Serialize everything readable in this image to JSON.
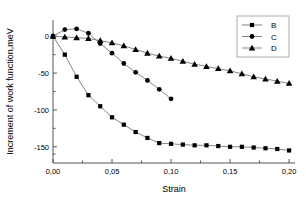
{
  "chart_data": {
    "type": "line",
    "title": "",
    "xlabel": "Strain",
    "ylabel": "Increment of work function,meV",
    "xlim": [
      0.0,
      0.205
    ],
    "ylim": [
      -172,
      22
    ],
    "grid": false,
    "legend_position": "top-right",
    "xticks": [
      "0,00",
      "0,05",
      "0,10",
      "0,15",
      "0,20"
    ],
    "xtick_values": [
      0.0,
      0.05,
      0.1,
      0.15,
      0.2
    ],
    "yticks": [
      "0",
      "-50",
      "-100",
      "-150"
    ],
    "ytick_values": [
      0,
      -50,
      -100,
      -150
    ],
    "series": [
      {
        "name": "B",
        "marker": "square",
        "color": "#000000",
        "x": [
          0.0,
          0.01,
          0.02,
          0.03,
          0.04,
          0.05,
          0.06,
          0.07,
          0.08,
          0.09,
          0.1,
          0.11,
          0.12,
          0.13,
          0.14,
          0.15,
          0.16,
          0.17,
          0.18,
          0.19,
          0.2
        ],
        "values": [
          0,
          -25,
          -55,
          -80,
          -95,
          -110,
          -120,
          -130,
          -138,
          -145,
          -146,
          -147,
          -148,
          -148,
          -149,
          -150,
          -150,
          -151,
          -152,
          -153,
          -155
        ]
      },
      {
        "name": "C",
        "marker": "circle",
        "color": "#000000",
        "x": [
          0.0,
          0.01,
          0.02,
          0.03,
          0.04,
          0.05,
          0.06,
          0.07,
          0.08,
          0.09,
          0.1
        ],
        "values": [
          0,
          9,
          10,
          4,
          -10,
          -23,
          -37,
          -49,
          -60,
          -72,
          -85
        ]
      },
      {
        "name": "D",
        "marker": "triangle",
        "color": "#000000",
        "x": [
          0.0,
          0.01,
          0.02,
          0.03,
          0.04,
          0.05,
          0.06,
          0.07,
          0.08,
          0.09,
          0.1,
          0.11,
          0.12,
          0.13,
          0.14,
          0.15,
          0.16,
          0.17,
          0.18,
          0.19,
          0.2
        ],
        "values": [
          0,
          -1,
          -2,
          -3,
          -6,
          -9,
          -13,
          -18,
          -23,
          -27,
          -30,
          -34,
          -38,
          -41,
          -44,
          -47,
          -51,
          -55,
          -58,
          -61,
          -64
        ]
      }
    ]
  },
  "legend": {
    "entries": [
      {
        "label": "B",
        "marker": "square"
      },
      {
        "label": "C",
        "marker": "circle"
      },
      {
        "label": "D",
        "marker": "triangle"
      }
    ]
  }
}
